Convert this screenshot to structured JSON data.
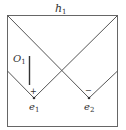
{
  "diagram": {
    "type": "box-with-crossed-diagonals",
    "colors": {
      "stroke": "#555555",
      "text": "#333333",
      "background": "#ffffff"
    },
    "labels": {
      "top": {
        "base": "h",
        "sub": "1"
      },
      "bar": {
        "base": "O",
        "sub": "1"
      },
      "left_vertex": {
        "base": "e",
        "sub": "1"
      },
      "right_vertex": {
        "base": "e",
        "sub": "2"
      },
      "left_sign": "+",
      "right_sign": "−"
    }
  }
}
